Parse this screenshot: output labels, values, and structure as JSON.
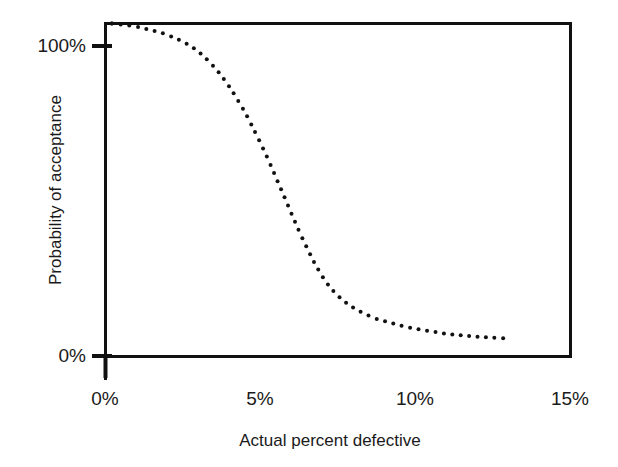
{
  "chart_data": {
    "type": "line",
    "style": "dotted-marker-curve",
    "title": "",
    "subtitle": "",
    "xlabel": "Actual percent defective",
    "ylabel": "Probability of acceptance",
    "xlim": [
      0,
      15
    ],
    "ylim": [
      0,
      100
    ],
    "xticks": [
      0,
      5,
      10,
      15
    ],
    "xticklabels": [
      "0%",
      "5%",
      "10%",
      "15%"
    ],
    "yticks": [
      0,
      100
    ],
    "yticklabels": [
      "0%",
      "100%"
    ],
    "grid": false,
    "legend": null,
    "legend_position": "none",
    "frame": "box",
    "series": [
      {
        "name": "Operating characteristic curve",
        "marker": "dot",
        "marker_color": "#111111",
        "marker_size_px": 4,
        "x": [
          0.2,
          0.6,
          1.0,
          1.4,
          1.8,
          2.2,
          2.6,
          3.0,
          3.4,
          3.8,
          4.2,
          4.6,
          5.0,
          5.3,
          5.6,
          5.9,
          6.2,
          6.5,
          6.8,
          7.1,
          7.4,
          7.7,
          8.0,
          8.4,
          8.8,
          9.2,
          9.6,
          10.0,
          10.5,
          11.0,
          11.5,
          12.0,
          12.5,
          13.0
        ],
        "y": [
          100.0,
          99.6,
          99.0,
          98.2,
          97.2,
          95.8,
          94.0,
          91.5,
          88.0,
          83.5,
          78.0,
          71.5,
          64.0,
          58.0,
          51.5,
          45.0,
          38.5,
          32.5,
          27.0,
          22.5,
          19.0,
          16.5,
          14.5,
          12.5,
          11.0,
          10.0,
          9.0,
          8.2,
          7.4,
          6.7,
          6.2,
          5.8,
          5.5,
          5.3
        ]
      }
    ],
    "annotations": []
  },
  "axes": {
    "x_tick_labels": [
      {
        "value": 0,
        "text": "0%"
      },
      {
        "value": 5,
        "text": "5%"
      },
      {
        "value": 10,
        "text": "10%"
      },
      {
        "value": 15,
        "text": "15%"
      }
    ],
    "y_tick_labels": [
      {
        "value": 100,
        "text": "100%"
      },
      {
        "value": 0,
        "text": "0%"
      }
    ],
    "x_title": "Actual percent defective",
    "y_title": "Probability of acceptance"
  },
  "colors": {
    "axis": "#111111",
    "marker": "#111111",
    "text": "#1a1a1a",
    "background": "#ffffff"
  }
}
